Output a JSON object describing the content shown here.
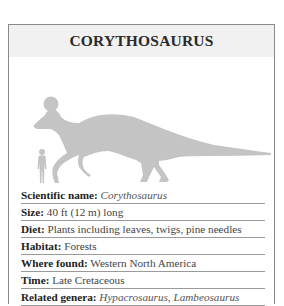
{
  "card": {
    "title": "CORYTHOSAURUS",
    "silhouette_color": "#c4c4c4",
    "header_bg": "#f1f1f1",
    "figures": [
      "human-silhouette",
      "dinosaur-silhouette"
    ]
  },
  "facts": [
    {
      "label": "Scientific name:",
      "value": "Corythosaurus",
      "italic": true
    },
    {
      "label": "Size:",
      "value": " 40 ft (12 m) long",
      "italic": false
    },
    {
      "label": "Diet:",
      "value": " Plants including leaves, twigs, pine needles",
      "italic": false
    },
    {
      "label": "Habitat:",
      "value": " Forests",
      "italic": false
    },
    {
      "label": "Where found:",
      "value": " Western North America",
      "italic": false
    },
    {
      "label": "Time:",
      "value": " Late Cretaceous",
      "italic": false
    },
    {
      "label": "Related genera:",
      "value": " Hypacrosaurus, Lambeosaurus",
      "italic": true
    }
  ]
}
